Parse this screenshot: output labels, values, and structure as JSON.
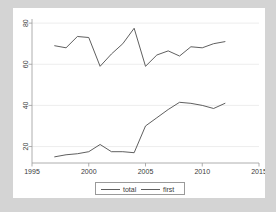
{
  "figure": {
    "background_color": "#d4d4d4",
    "plot_background_color": "#ffffff",
    "line_color": "#4d4d4d",
    "grid_color": "#e8e8e8",
    "frame_color": "#9a9a9a"
  },
  "chart_data": {
    "type": "line",
    "title": "",
    "subtitle": "",
    "xlabel": "year",
    "ylabel": "",
    "xlim": [
      1995,
      2015
    ],
    "ylim": [
      12,
      82
    ],
    "xticks": [
      1995,
      2000,
      2005,
      2010,
      2015
    ],
    "yticks": [
      20,
      40,
      60,
      80
    ],
    "xticklabels": [
      "1995",
      "2000",
      "2005",
      "2010",
      "2015"
    ],
    "yticklabels": [
      "20",
      "40",
      "60",
      "80"
    ],
    "grid": "horizontal",
    "legend_position": "below-center",
    "x": [
      1997,
      1998,
      1999,
      2000,
      2001,
      2002,
      2003,
      2004,
      2005,
      2006,
      2007,
      2008,
      2009,
      2010,
      2011,
      2012
    ],
    "series": [
      {
        "name": "total",
        "label": "total",
        "values": [
          69,
          68,
          73.5,
          73,
          59,
          65,
          70,
          77.5,
          59,
          64.5,
          66.5,
          64,
          68.5,
          68,
          70,
          71
        ]
      },
      {
        "name": "first",
        "label": "first",
        "values": [
          15,
          16,
          16.5,
          17.5,
          21,
          17.5,
          17.5,
          17,
          30,
          34,
          38,
          41.5,
          41,
          40,
          38.5,
          41
        ]
      }
    ]
  },
  "legend": {
    "items": [
      {
        "label": "total",
        "key": "legend-key-total"
      },
      {
        "label": "first",
        "key": "legend-key-first"
      }
    ]
  },
  "axis": {
    "x_title": "year",
    "y_title": ""
  }
}
